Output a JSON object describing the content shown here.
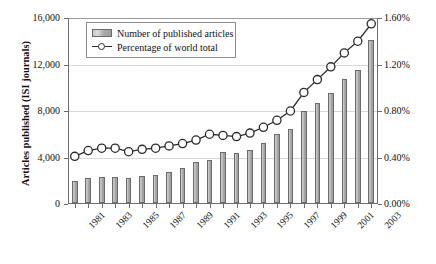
{
  "chart_data": {
    "type": "bar",
    "title": "",
    "subtitle": "",
    "xlabel": "",
    "ylabel": "Articles published (ISI journals)",
    "ylabel_right": "Fraction of world total (%)",
    "grid": true,
    "legend_position": "top-left",
    "x": [
      1981,
      1982,
      1983,
      1984,
      1985,
      1986,
      1987,
      1988,
      1989,
      1990,
      1991,
      1992,
      1993,
      1994,
      1995,
      1996,
      1997,
      1998,
      1999,
      2000,
      2001,
      2002,
      2003
    ],
    "categories": [
      "1981",
      "1982",
      "1983",
      "1984",
      "1985",
      "1986",
      "1987",
      "1988",
      "1989",
      "1990",
      "1991",
      "1992",
      "1993",
      "1994",
      "1995",
      "1996",
      "1997",
      "1998",
      "1999",
      "2000",
      "2001",
      "2002",
      "2003"
    ],
    "xtick_labels": [
      "1981",
      "1983",
      "1985",
      "1987",
      "1989",
      "1991",
      "1993",
      "1995",
      "1997",
      "1999",
      "2001",
      "2003"
    ],
    "ylim": [
      0,
      16000
    ],
    "ylim_right": [
      0,
      1.6
    ],
    "ytick_labels_left": [
      "0",
      "4,000",
      "8,000",
      "12,000",
      "16,000"
    ],
    "ytick_values_left": [
      0,
      4000,
      8000,
      12000,
      16000
    ],
    "ytick_labels_right": [
      "0.00%",
      "0.40%",
      "0.80%",
      "1.20%",
      "1.60%"
    ],
    "ytick_values_right": [
      0,
      0.4,
      0.8,
      1.2,
      1.6
    ],
    "series": [
      {
        "name": "Number of published articles",
        "type": "bar",
        "axis": "left",
        "color": "#b4b4b4",
        "edge_color": "#6b6b6b",
        "values": [
          1900,
          2150,
          2200,
          2200,
          2180,
          2350,
          2450,
          2700,
          3050,
          3500,
          3700,
          4350,
          4300,
          4550,
          5200,
          5900,
          6400,
          7900,
          8600,
          9500,
          10700,
          11450,
          14000
        ]
      },
      {
        "name": "Percentage of world total",
        "type": "line",
        "axis": "right",
        "color": "#2a2a2a",
        "marker": "circle-open",
        "values": [
          0.41,
          0.46,
          0.48,
          0.48,
          0.45,
          0.47,
          0.48,
          0.5,
          0.52,
          0.55,
          0.6,
          0.59,
          0.58,
          0.61,
          0.66,
          0.72,
          0.8,
          0.96,
          1.07,
          1.18,
          1.3,
          1.4,
          1.55
        ]
      }
    ]
  },
  "legend": {
    "items": [
      {
        "label": "Number of published articles",
        "kind": "bar"
      },
      {
        "label": "Percentage of world total",
        "kind": "line"
      }
    ]
  },
  "axes": {
    "left_title": "Articles published (ISI journals)",
    "right_title": "Fraction of world total (%)"
  }
}
